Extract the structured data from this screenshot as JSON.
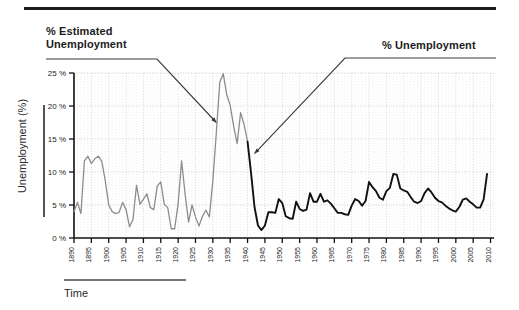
{
  "figure": {
    "top_rule": "horizontal-rule",
    "annotations": [
      {
        "id": "estimated",
        "text": "% Estimated\nUnemployment",
        "target_year": 1931,
        "target_value": 17.5
      },
      {
        "id": "actual",
        "text": "% Unemployment",
        "target_year": 1942,
        "target_value": 12.8
      }
    ]
  },
  "chart_data": {
    "type": "line",
    "title": "",
    "xlabel": "Time",
    "ylabel": "Unemployment (%)",
    "xlim": [
      1890,
      2011
    ],
    "ylim": [
      0,
      26
    ],
    "grid": true,
    "legend_position": "annotation-callouts",
    "y_ticks": [
      0,
      5,
      10,
      15,
      20,
      25
    ],
    "y_tick_labels": [
      "0 %",
      "5 %",
      "10 %",
      "15 %",
      "20 %",
      "25 %"
    ],
    "x_ticks": [
      1890,
      1895,
      1900,
      1905,
      1910,
      1915,
      1920,
      1925,
      1930,
      1935,
      1940,
      1945,
      1950,
      1955,
      1960,
      1965,
      1970,
      1975,
      1980,
      1985,
      1990,
      1995,
      2000,
      2005,
      2010
    ],
    "x_tick_labels": [
      "1890",
      "1895",
      "1900",
      "1905",
      "1910",
      "1915",
      "1920",
      "1925",
      "1930",
      "1935",
      "1940",
      "1945",
      "1950",
      "1955",
      "1960",
      "1965",
      "1970",
      "1975",
      "1980",
      "1985",
      "1990",
      "1995",
      "2000",
      "2005",
      "2010"
    ],
    "series": [
      {
        "name": "% Estimated Unemployment",
        "color": "#8c8c8c",
        "x": [
          1890,
          1891,
          1892,
          1893,
          1894,
          1895,
          1896,
          1897,
          1898,
          1899,
          1900,
          1901,
          1902,
          1903,
          1904,
          1905,
          1906,
          1907,
          1908,
          1909,
          1910,
          1911,
          1912,
          1913,
          1914,
          1915,
          1916,
          1917,
          1918,
          1919,
          1920,
          1921,
          1922,
          1923,
          1924,
          1925,
          1926,
          1927,
          1928,
          1929,
          1930,
          1931,
          1932,
          1933,
          1934,
          1935,
          1936,
          1937,
          1938,
          1939,
          1940
        ],
        "values": [
          4.0,
          5.4,
          3.7,
          11.7,
          12.4,
          11.3,
          12.0,
          12.4,
          11.6,
          8.7,
          5.0,
          4.0,
          3.7,
          3.9,
          5.4,
          4.3,
          1.7,
          2.8,
          8.0,
          5.1,
          5.9,
          6.7,
          4.6,
          4.3,
          7.9,
          8.5,
          5.1,
          4.6,
          1.4,
          1.4,
          5.2,
          11.7,
          6.7,
          2.4,
          5.0,
          3.2,
          1.8,
          3.3,
          4.2,
          3.2,
          8.7,
          15.9,
          23.6,
          24.9,
          21.7,
          20.1,
          16.9,
          14.3,
          19.0,
          17.2,
          14.6
        ]
      },
      {
        "name": "% Unemployment",
        "color": "#111111",
        "x": [
          1940,
          1941,
          1942,
          1943,
          1944,
          1945,
          1946,
          1947,
          1948,
          1949,
          1950,
          1951,
          1952,
          1953,
          1954,
          1955,
          1956,
          1957,
          1958,
          1959,
          1960,
          1961,
          1962,
          1963,
          1964,
          1965,
          1966,
          1967,
          1968,
          1969,
          1970,
          1971,
          1972,
          1973,
          1974,
          1975,
          1976,
          1977,
          1978,
          1979,
          1980,
          1981,
          1982,
          1983,
          1984,
          1985,
          1986,
          1987,
          1988,
          1989,
          1990,
          1991,
          1992,
          1993,
          1994,
          1995,
          1996,
          1997,
          1998,
          1999,
          2000,
          2001,
          2002,
          2003,
          2004,
          2005,
          2006,
          2007,
          2008,
          2009
        ],
        "values": [
          14.6,
          9.9,
          4.7,
          1.9,
          1.2,
          1.9,
          3.9,
          3.9,
          3.8,
          5.9,
          5.3,
          3.3,
          3.0,
          2.9,
          5.5,
          4.4,
          4.1,
          4.3,
          6.8,
          5.5,
          5.5,
          6.7,
          5.5,
          5.7,
          5.2,
          4.5,
          3.8,
          3.8,
          3.6,
          3.5,
          4.9,
          5.9,
          5.6,
          4.9,
          5.6,
          8.5,
          7.7,
          7.1,
          6.1,
          5.8,
          7.1,
          7.6,
          9.7,
          9.6,
          7.5,
          7.2,
          7.0,
          6.2,
          5.5,
          5.3,
          5.6,
          6.8,
          7.5,
          6.9,
          6.1,
          5.6,
          5.4,
          4.9,
          4.5,
          4.2,
          4.0,
          4.7,
          5.8,
          6.0,
          5.5,
          5.1,
          4.6,
          4.6,
          5.8,
          9.7
        ]
      }
    ]
  }
}
